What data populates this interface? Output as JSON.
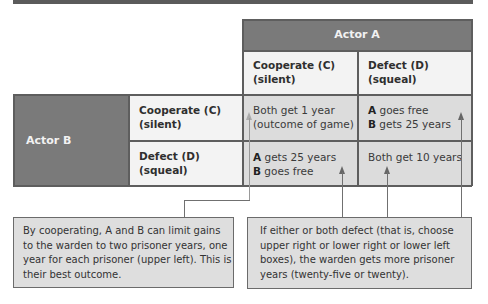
{
  "matrix": {
    "column_actor": "Actor A",
    "row_actor": "Actor B",
    "columns": [
      {
        "line1": "Cooperate (C)",
        "line2": "(silent)"
      },
      {
        "line1": "Defect (D)",
        "line2": "(squeal)"
      }
    ],
    "rows": [
      {
        "line1": "Cooperate (C)",
        "line2": "(silent)"
      },
      {
        "line1": "Defect (D)",
        "line2": "(squeal)"
      }
    ],
    "cells": {
      "cc": {
        "line1": "Both get 1 year",
        "line2": "(outcome of game)"
      },
      "cd": {
        "a_label": "A",
        "a_text": " goes free",
        "b_label": "B",
        "b_text": " gets 25 years"
      },
      "dc": {
        "a_label": "A",
        "a_text": " gets 25 years",
        "b_label": "B",
        "b_text": " goes free"
      },
      "dd": {
        "line1": "Both get 10 years"
      }
    }
  },
  "notes": {
    "left": "By cooperating, A and B can limit gains to the warden to two prisoner years, one year for each prisoner (upper left). This is their best outcome.",
    "right": "If either or both defect (that is, choose upper right or lower right or lower left boxes), the warden gets more prisoner years (twenty-five or twenty)."
  },
  "colors": {
    "header_dark": "#7a7a7a",
    "header_light": "#f3f3f3",
    "cell_gray": "#dcdcdc",
    "note_bg": "#dedede"
  }
}
